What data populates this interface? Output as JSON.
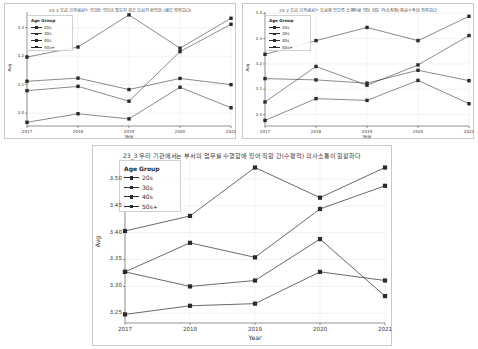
{
  "figure": {
    "background_color": "#ffffff",
    "panel_border_color": "#c8c8c8",
    "line_color": "#2a2a2a",
    "grid_color": "#e4e4e4"
  },
  "legend": {
    "title": "Age Group",
    "entries": [
      "20s",
      "30s",
      "40s",
      "50s+"
    ]
  },
  "panels": [
    {
      "id": "panel-1",
      "title": "23_1 우리 기관에서는 업무상 얻기가 필요한 경우 부서간 협업이 (매우 원활하다)",
      "xlabel": "Year",
      "ylabel": "Avg",
      "xticks": [
        "2017",
        "2018",
        "2019",
        "2020",
        "2021"
      ],
      "yticks": [
        "3.0",
        "3.1",
        "3.2",
        "3.3"
      ]
    },
    {
      "id": "panel-2",
      "title": "23_2 우리 기관에서는 부서의 업무를 수행함에 있어 상하 간(수직적) 의사소통이 원활하다",
      "xlabel": "Year",
      "ylabel": "Avg",
      "xticks": [
        "2017",
        "2018",
        "2019",
        "2020",
        "2021"
      ],
      "yticks": [
        "3.0",
        "3.1",
        "3.2",
        "3.3",
        "3.4"
      ]
    },
    {
      "id": "panel-3",
      "title": "23_3 우리 기관에서는 부서의 업무를 수행함에 있어 직원 간(수평적) 의사소통이 원활하다",
      "xlabel": "Year",
      "ylabel": "Avg",
      "xticks": [
        "2017",
        "2018",
        "2019",
        "2020",
        "2021"
      ],
      "yticks": [
        "3.25",
        "3.30",
        "3.35",
        "3.40",
        "3.45",
        "3.50"
      ]
    }
  ],
  "chart_data": [
    {
      "type": "line",
      "panel": "panel-1",
      "title": "23_1 우리 기관에서는 업무상 얻기가 필요한 경우 부서간 협업이 (매우 원활하다)",
      "xlabel": "Year",
      "ylabel": "Avg",
      "x": [
        "2017",
        "2018",
        "2019",
        "2020",
        "2021"
      ],
      "ylim": [
        2.955,
        3.355
      ],
      "yticks": [
        3.0,
        3.1,
        3.2,
        3.3
      ],
      "grid": true,
      "legend_position": "upper-left",
      "series": [
        {
          "name": "20s",
          "values": [
            3.197,
            3.232,
            3.345,
            3.228,
            3.333
          ]
        },
        {
          "name": "30s",
          "values": [
            3.112,
            3.123,
            3.083,
            3.122,
            3.1
          ]
        },
        {
          "name": "40s",
          "values": [
            3.079,
            3.094,
            3.042,
            3.216,
            3.312
          ]
        },
        {
          "name": "50s+",
          "values": [
            2.968,
            2.998,
            2.98,
            3.091,
            3.019
          ]
        }
      ]
    },
    {
      "type": "line",
      "panel": "panel-2",
      "title": "23_2 우리 기관에서는 부서의 업무를 수행함에 있어 상하 간(수직적) 의사소통이 원활하다",
      "xlabel": "Year",
      "ylabel": "Avg",
      "x": [
        "2017",
        "2018",
        "2019",
        "2020",
        "2021"
      ],
      "ylim": [
        2.955,
        3.405
      ],
      "yticks": [
        3.0,
        3.1,
        3.2,
        3.3,
        3.4
      ],
      "grid": true,
      "legend_position": "upper-left",
      "series": [
        {
          "name": "20s",
          "values": [
            3.238,
            3.292,
            3.344,
            3.292,
            3.388
          ]
        },
        {
          "name": "30s",
          "values": [
            3.142,
            3.137,
            3.124,
            3.175,
            3.134
          ]
        },
        {
          "name": "40s",
          "values": [
            3.05,
            3.19,
            3.116,
            3.196,
            3.312
          ]
        },
        {
          "name": "50s+",
          "values": [
            2.977,
            3.063,
            3.056,
            3.135,
            3.043
          ]
        }
      ]
    },
    {
      "type": "line",
      "panel": "panel-3",
      "title": "23_3 우리 기관에서는 부서의 업무를 수행함에 있어 직원 간(수평적) 의사소통이 원활하다",
      "xlabel": "Year",
      "ylabel": "Avg",
      "x": [
        "2017",
        "2018",
        "2019",
        "2020",
        "2021"
      ],
      "ylim": [
        3.232,
        3.535
      ],
      "yticks": [
        3.25,
        3.3,
        3.35,
        3.4,
        3.45,
        3.5
      ],
      "grid": true,
      "legend_position": "upper-left",
      "series": [
        {
          "name": "20s",
          "values": [
            3.403,
            3.431,
            3.521,
            3.465,
            3.521
          ]
        },
        {
          "name": "30s",
          "values": [
            3.327,
            3.381,
            3.354,
            3.444,
            3.487
          ]
        },
        {
          "name": "40s",
          "values": [
            3.327,
            3.3,
            3.311,
            3.388,
            3.282
          ]
        },
        {
          "name": "50s+",
          "values": [
            3.248,
            3.264,
            3.268,
            3.327,
            3.311
          ]
        }
      ]
    }
  ]
}
